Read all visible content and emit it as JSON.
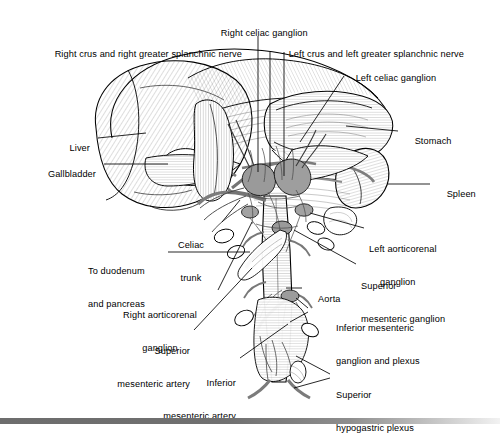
{
  "figure": {
    "type": "anatomical-line-drawing",
    "style": "black-and-white engraved hatching with gray vessels",
    "colors": {
      "background": "#ffffff",
      "ink": "#000000",
      "vessel_gray": "#8a8a8a",
      "vessel_gray_dark": "#6b6b6b",
      "organ_fill": "#ffffff",
      "footer_bar_dark": "#6d6d6d",
      "footer_bar_light": "#f2f2f2"
    }
  },
  "labels": [
    {
      "id": "right-celiac-ganglion",
      "text": "Right celiac ganglion",
      "align": "center"
    },
    {
      "id": "right-crus-splanchnic",
      "text": "Right crus and right greater splanchnic nerve",
      "align": "left"
    },
    {
      "id": "left-crus-splanchnic",
      "text": "Left crus and left greater splanchnic nerve",
      "align": "left"
    },
    {
      "id": "left-celiac-ganglion",
      "text": "Left celiac ganglion",
      "align": "left"
    },
    {
      "id": "liver",
      "text": "Liver",
      "align": "right"
    },
    {
      "id": "gallbladder",
      "text": "Gallbladder",
      "align": "right"
    },
    {
      "id": "stomach",
      "text": "Stomach",
      "align": "left"
    },
    {
      "id": "spleen",
      "text": "Spleen",
      "align": "left"
    },
    {
      "id": "celiac-trunk",
      "text": "Celiac\ntrunk",
      "align": "center"
    },
    {
      "id": "to-duodenum-and-pancreas",
      "text": "To duodenum\nand pancreas",
      "align": "left"
    },
    {
      "id": "right-aorticorenal-ganglion",
      "text": "Right aorticorenal\nganglion",
      "align": "center"
    },
    {
      "id": "left-aorticorenal-ganglion",
      "text": "Left aorticorenal\nganglion",
      "align": "left"
    },
    {
      "id": "superior-mesenteric-ganglion",
      "text": "Superior\nmesenteric ganglion",
      "align": "left"
    },
    {
      "id": "aorta",
      "text": "Aorta",
      "align": "left"
    },
    {
      "id": "inferior-mesenteric-ganglion",
      "text": "Inferior mesenteric\nganglion and plexus",
      "align": "left"
    },
    {
      "id": "superior-mesenteric-artery",
      "text": "Superior\nmesenteric artery",
      "align": "right"
    },
    {
      "id": "inferior-mesenteric-artery",
      "text": "Inferior\nmesenteric artery",
      "align": "right"
    },
    {
      "id": "superior-hypogastric-plexus",
      "text": "Superior\nhypogastric plexus",
      "align": "left"
    }
  ],
  "label_text": {
    "right_celiac_ganglion": "Right celiac ganglion",
    "right_crus_splanchnic": "Right crus and right greater splanchnic nerve",
    "left_crus_splanchnic": "Left crus and left greater splanchnic nerve",
    "left_celiac_ganglion": "Left celiac ganglion",
    "liver": "Liver",
    "gallbladder": "Gallbladder",
    "stomach": "Stomach",
    "spleen": "Spleen",
    "celiac_trunk_1": "Celiac",
    "celiac_trunk_2": "trunk",
    "to_duodenum_1": "To duodenum",
    "to_duodenum_2": "and pancreas",
    "right_aorticorenal_1": "Right aorticorenal",
    "right_aorticorenal_2": "ganglion",
    "left_aorticorenal_1": "Left aorticorenal",
    "left_aorticorenal_2": "ganglion",
    "sup_mes_ganglion_1": "Superior",
    "sup_mes_ganglion_2": "mesenteric ganglion",
    "aorta": "Aorta",
    "inf_mes_ganglion_1": "Inferior mesenteric",
    "inf_mes_ganglion_2": "ganglion and plexus",
    "sup_mes_artery_1": "Superior",
    "sup_mes_artery_2": "mesenteric artery",
    "inf_mes_artery_1": "Inferior",
    "inf_mes_artery_2": "mesenteric artery",
    "sup_hypogastric_1": "Superior",
    "sup_hypogastric_2": "hypogastric plexus"
  }
}
